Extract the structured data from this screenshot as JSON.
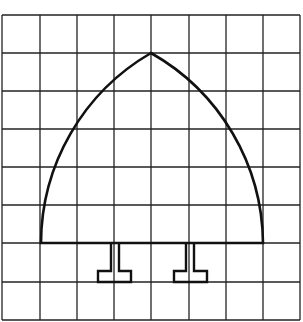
{
  "diagram": {
    "type": "grid-drawing",
    "grid": {
      "columns": 8,
      "rows": 8,
      "x_lines": [
        2,
        40,
        77,
        114,
        151,
        189,
        226,
        263,
        300
      ],
      "y_lines": [
        15,
        53,
        91,
        129,
        167,
        205,
        243,
        282,
        320
      ],
      "line_color": "#222222"
    },
    "arch": {
      "apex": [
        151,
        53
      ],
      "base_left": [
        41,
        243
      ],
      "base_right": [
        263,
        243
      ],
      "stroke_color": "#111111"
    },
    "feet": [
      {
        "name": "left-foot",
        "stem_left": 111,
        "stem_right": 119,
        "base_left": 98,
        "base_right": 131,
        "top": 243,
        "step_y": 271,
        "bottom": 282
      },
      {
        "name": "right-foot",
        "stem_left": 186,
        "stem_right": 194,
        "base_left": 174,
        "base_right": 207,
        "top": 243,
        "step_y": 271,
        "bottom": 282
      }
    ]
  }
}
